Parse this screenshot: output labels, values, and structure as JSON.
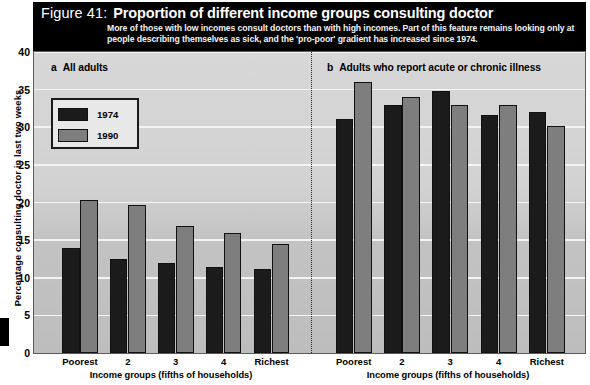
{
  "figure": {
    "number_label": "Figure 41:",
    "title": "Proportion of different income groups consulting doctor",
    "subtitle": "More of those with low incomes consult doctors than with high incomes. Part of this feature remains looking only at people describing themselves as sick, and the 'pro-poor' gradient has increased since 1974."
  },
  "legend": {
    "series": [
      {
        "name": "1974",
        "color": "#1b1b1b"
      },
      {
        "name": "1990",
        "color": "#7e7e7e"
      }
    ]
  },
  "axes": {
    "y_title": "Percentage consulting doctor in last two weeks",
    "y_ticks": [
      "0",
      "5",
      "10",
      "15",
      "20",
      "25",
      "30",
      "35",
      "40"
    ],
    "x_title": "Income groups (fifths of households)",
    "x_ticks": [
      "Poorest",
      "2",
      "3",
      "4",
      "Richest"
    ]
  },
  "panels": [
    {
      "letter": "a",
      "caption": "All adults"
    },
    {
      "letter": "b",
      "caption": "Adults who report acute or chronic illness"
    }
  ],
  "chart_data": {
    "type": "bar",
    "title": "Proportion of different income groups consulting doctor",
    "subtitle": "More of those with low incomes consult doctors than with high incomes. Part of this feature remains looking only at people describing themselves as sick, and the 'pro-poor' gradient has increased since 1974.",
    "xlabel": "Income groups (fifths of households)",
    "ylabel": "Percentage consulting doctor in last two weeks",
    "ylim": [
      0,
      40
    ],
    "ytick_step": 5,
    "grid": true,
    "legend_position": "top-left",
    "categories": [
      "Poorest",
      "2",
      "3",
      "4",
      "Richest"
    ],
    "panels": [
      {
        "letter": "a",
        "caption": "All adults",
        "series": [
          {
            "name": "1974",
            "color": "#1b1b1b",
            "values": [
              14.0,
              12.5,
              12.0,
              11.4,
              11.2
            ]
          },
          {
            "name": "1990",
            "color": "#7e7e7e",
            "values": [
              20.4,
              19.7,
              16.9,
              16.0,
              14.5
            ]
          }
        ]
      },
      {
        "letter": "b",
        "caption": "Adults who report acute or chronic illness",
        "series": [
          {
            "name": "1974",
            "color": "#1b1b1b",
            "values": [
              31.1,
              33.0,
              34.8,
              31.6,
              32.0
            ]
          },
          {
            "name": "1990",
            "color": "#7e7e7e",
            "values": [
              36.0,
              34.0,
              33.0,
              33.0,
              30.2
            ]
          }
        ]
      }
    ]
  }
}
